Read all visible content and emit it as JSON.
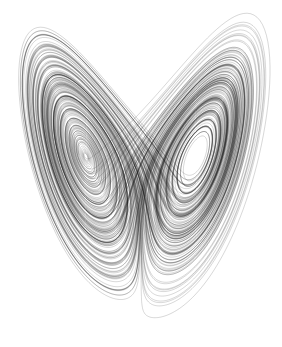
{
  "image": {
    "subject": "Lorenz attractor",
    "description": "Butterfly-shaped strange attractor drawn as dense grey/black trajectory lines on white background",
    "background_color": "#ffffff",
    "line_color": "#1a1a1a",
    "parameters": {
      "sigma": 10,
      "rho": 28,
      "beta": 2.6667
    },
    "wings": [
      "left",
      "right"
    ]
  }
}
